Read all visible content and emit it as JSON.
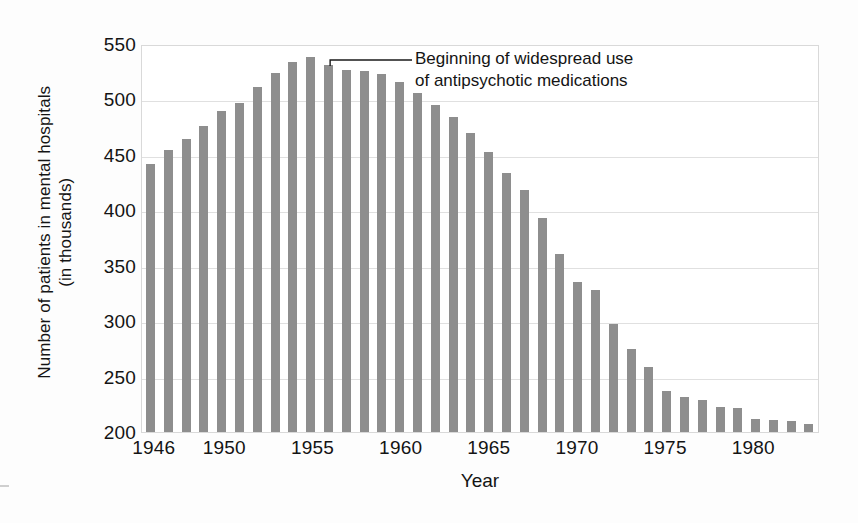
{
  "chart_data": {
    "type": "bar",
    "title": "",
    "xlabel": "Year",
    "ylabel": "Number of patients in mental hospitals (in thousands)",
    "ylabel_line1": "Number of patients in mental hospitals",
    "ylabel_line2": "(in thousands)",
    "ylim": [
      200,
      550
    ],
    "ytick_values": [
      550,
      500,
      450,
      400,
      350,
      300,
      250,
      200
    ],
    "ytick_labels": [
      "550",
      "500",
      "450",
      "400",
      "350",
      "300",
      "250",
      "200"
    ],
    "grid": true,
    "legend": "none",
    "bar_color": "#8e8e8e",
    "gridline_color": "#e0e0e0",
    "axis_color": "#d9d9d9",
    "xtick_labels": [
      "1946",
      "1950",
      "1955",
      "1960",
      "1965",
      "1970",
      "1975",
      "1980"
    ],
    "xtick_years": [
      1946,
      1950,
      1955,
      1960,
      1965,
      1970,
      1975,
      1980
    ],
    "categories": [
      "1946",
      "1947",
      "1948",
      "1949",
      "1950",
      "1951",
      "1952",
      "1953",
      "1954",
      "1955",
      "1956",
      "1957",
      "1958",
      "1959",
      "1960",
      "1961",
      "1962",
      "1963",
      "1964",
      "1965",
      "1966",
      "1967",
      "1968",
      "1969",
      "1970",
      "1971",
      "1972",
      "1973",
      "1974",
      "1975",
      "1976",
      "1977",
      "1978",
      "1979",
      "1980",
      "1981",
      "1982",
      "1983"
    ],
    "values": [
      442,
      454,
      464,
      476,
      490,
      497,
      511,
      524,
      534,
      538,
      531,
      527,
      526,
      523,
      516,
      506,
      495,
      484,
      470,
      453,
      434,
      418,
      393,
      361,
      335,
      328,
      297,
      275,
      259,
      237,
      232,
      229,
      223,
      222,
      212,
      211,
      210,
      207
    ],
    "units": "thousands of patients",
    "annotations": [
      {
        "text": "Beginning of widespread use of antipsychotic medications",
        "line1": "Beginning of widespread use",
        "line2": "of antipsychotic medications",
        "points_to_year": "1956",
        "points_to_value": 531
      }
    ]
  }
}
